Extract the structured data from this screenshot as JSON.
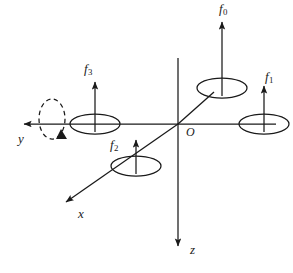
{
  "figure": {
    "type": "quadrotor-body-frame-diagram",
    "background_color": "#ffffff",
    "stroke_color": "#1a1a1a"
  },
  "axes": [
    {
      "id": "y",
      "label": "y",
      "direction": "left",
      "arrow": true,
      "label_x": 18,
      "label_y": 132
    },
    {
      "id": "x",
      "label": "x",
      "direction": "down-left",
      "arrow": true,
      "label_x": 78,
      "label_y": 207
    },
    {
      "id": "z",
      "label": "z",
      "direction": "down",
      "arrow": true,
      "label_x": 190,
      "label_y": 243
    }
  ],
  "origin": {
    "label": "O",
    "label_x": 186,
    "label_y": 126,
    "x": 178,
    "y": 124
  },
  "rotors": [
    {
      "id": "f0",
      "label": "f",
      "subscript": "0",
      "arm": "x-positive",
      "label_x": 219,
      "label_y": 2,
      "rotor_cx": 222,
      "rotor_cy": 88
    },
    {
      "id": "f1",
      "label": "f",
      "subscript": "1",
      "arm": "y-negative",
      "label_x": 265,
      "label_y": 70,
      "rotor_cx": 264,
      "rotor_cy": 124
    },
    {
      "id": "f2",
      "label": "f",
      "subscript": "2",
      "arm": "x-negative",
      "label_x": 110,
      "label_y": 138,
      "rotor_cx": 136,
      "rotor_cy": 166
    },
    {
      "id": "f3",
      "label": "f",
      "subscript": "3",
      "arm": "y-positive",
      "label_x": 84,
      "label_y": 62,
      "rotor_cx": 95,
      "rotor_cy": 124
    }
  ],
  "rotation_indicator": {
    "name": "y-axis-rotation",
    "style": "dashed-ellipse-with-arrowhead",
    "cx": 52,
    "cy": 119
  }
}
